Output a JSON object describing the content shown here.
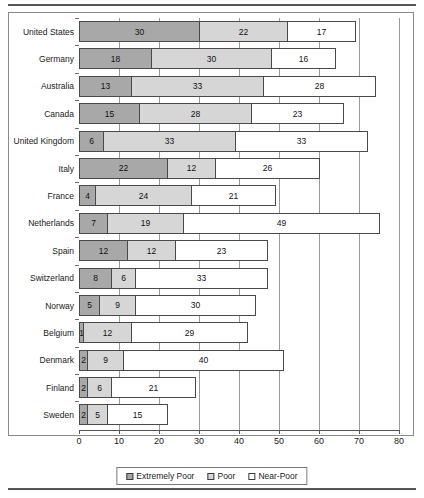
{
  "chart_data": {
    "type": "bar",
    "orientation": "horizontal",
    "stacked": true,
    "title": "",
    "xlabel": "",
    "ylabel": "",
    "xlim": [
      0,
      80
    ],
    "xticks": [
      0,
      10,
      20,
      30,
      40,
      50,
      60,
      70,
      80
    ],
    "xtick_labels": [
      "0",
      "10",
      "20",
      "30",
      "40",
      "50",
      "60",
      "70",
      "80"
    ],
    "grid": true,
    "legend_position": "bottom",
    "categories": [
      "United States",
      "Germany",
      "Australia",
      "Canada",
      "United Kingdom",
      "Italy",
      "France",
      "Netherlands",
      "Spain",
      "Switzerland",
      "Norway",
      "Belgium",
      "Denmark",
      "Finland",
      "Sweden"
    ],
    "series": [
      {
        "name": "Extremely Poor",
        "color": "#a8a8a8",
        "values": [
          30,
          18,
          13,
          15,
          6,
          22,
          4,
          7,
          12,
          8,
          5,
          1,
          2,
          2,
          2
        ]
      },
      {
        "name": "Poor",
        "color": "#d6d6d6",
        "values": [
          22,
          30,
          33,
          28,
          33,
          12,
          24,
          19,
          12,
          6,
          9,
          12,
          9,
          6,
          5
        ]
      },
      {
        "name": "Near-Poor",
        "color": "#ffffff",
        "values": [
          17,
          16,
          28,
          23,
          33,
          26,
          21,
          49,
          23,
          33,
          30,
          29,
          40,
          21,
          15
        ]
      }
    ],
    "totals": [
      69,
      64,
      74,
      66,
      72,
      60,
      49,
      75,
      47,
      47,
      44,
      42,
      51,
      29,
      22
    ]
  },
  "legend": {
    "items": [
      {
        "label": "Extremely Poor",
        "swatch": "sw-extreme"
      },
      {
        "label": "Poor",
        "swatch": "sw-poor"
      },
      {
        "label": "Near-Poor",
        "swatch": "sw-near"
      }
    ]
  }
}
